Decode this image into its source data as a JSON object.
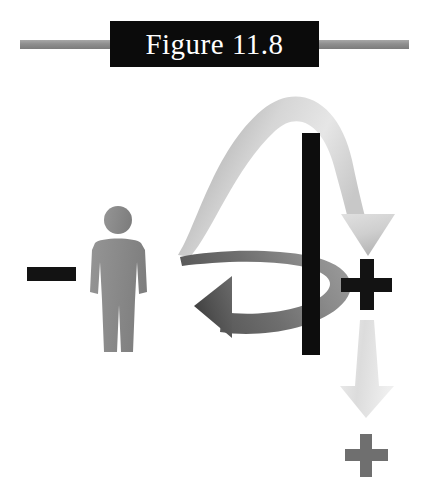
{
  "figure": {
    "title": "Figure 11.8",
    "caption_plate_color": "#0b0b0b",
    "title_text_color": "#ffffff",
    "rule_color": "#8e8e8e",
    "background_color": "#ffffff"
  },
  "diagram": {
    "person": {
      "label": "person-silhouette",
      "color": "#8c8c8c"
    },
    "barrier": {
      "label": "barrier",
      "color": "#0d0d0d"
    },
    "signs": {
      "minus": {
        "symbol": "−",
        "color": "#131313",
        "side": "left"
      },
      "plus_primary": {
        "symbol": "+",
        "color": "#131313",
        "side": "right"
      },
      "plus_secondary": {
        "symbol": "+",
        "color": "#6f6f6f",
        "side": "right"
      }
    },
    "arrows": {
      "over_barrier": {
        "label": "light-gray-arc-arrow-over-barrier",
        "direction": "left-over-top-then-down-right",
        "color_light": "#e3e3e3",
        "color_dark": "#9a9a9a"
      },
      "return_left": {
        "label": "dark-gray-ribbon-arrow-back-to-person",
        "direction": "right-to-left",
        "color_light": "#b0b0b0",
        "color_dark": "#4a4a4a"
      },
      "down_to_secondary_plus": {
        "label": "pale-gray-down-arrow",
        "direction": "down",
        "color_light": "#f0f0f0",
        "color_dark": "#cfcfcf"
      }
    }
  }
}
